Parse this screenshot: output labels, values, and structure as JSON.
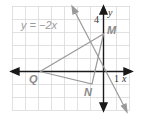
{
  "figure": {
    "type": "coordinate-plane",
    "equation_label": "y = −2x",
    "axis_labels": {
      "x": "x",
      "y": "y"
    },
    "tick_labels": {
      "x_unit": "1",
      "y_tick": "4"
    },
    "points": [
      {
        "name": "M",
        "x": 0,
        "y": 3
      },
      {
        "name": "N",
        "x": -1,
        "y": -1
      },
      {
        "name": "Q",
        "x": -6,
        "y": 0
      }
    ],
    "triangle": [
      "Q",
      "M",
      "N"
    ],
    "line": {
      "equation": "y = -2x",
      "slope": -2,
      "intercept": 0
    },
    "grid": {
      "x_range": [
        -7,
        2
      ],
      "y_range": [
        -3,
        5
      ],
      "unit": 1
    },
    "colors": {
      "grid": "#d9d9d9",
      "axis": "#1a1a1a",
      "figure_lines": "#9a9a9a",
      "labels": "#8a8a8a"
    }
  }
}
